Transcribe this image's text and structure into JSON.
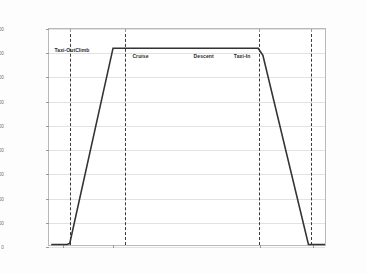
{
  "chart_data": {
    "type": "line",
    "title": "",
    "xlabel": "",
    "ylabel": "Flight Altitude (ft)",
    "ylim": [
      0,
      9000
    ],
    "ytick_labels": [
      "9000",
      "8000",
      "7000",
      "6000",
      "5000",
      "4000",
      "3000",
      "2000",
      "1000",
      "0"
    ],
    "ytick_values": [
      9000,
      8000,
      7000,
      6000,
      5000,
      4000,
      3000,
      2000,
      1000,
      0
    ],
    "xlim": [
      0,
      100
    ],
    "xtick_values": [
      5,
      23,
      76,
      95
    ],
    "xtick_labels": [
      "",
      "",
      "",
      ""
    ],
    "grid": true,
    "legend": "none",
    "series": [
      {
        "name": "Flight Profile",
        "x": [
          0.8,
          6.5,
          7.5,
          23.2,
          75.8,
          77.5,
          94.0,
          100.0
        ],
        "y": [
          20,
          20,
          60,
          8200,
          8200,
          7900,
          20,
          20
        ]
      }
    ],
    "phase_dividers": [
      {
        "name": "taxi-out-climb-divider",
        "x": 7.6
      },
      {
        "name": "climb-cruise-divider",
        "x": 27.3
      },
      {
        "name": "cruise-descent-divider",
        "x": 75.5
      },
      {
        "name": "descent-taxiin-divider",
        "x": 94.2
      }
    ],
    "phase_labels": [
      {
        "name": "Taxi-Out",
        "x": 2.0,
        "y": 8140
      },
      {
        "name": "Climb",
        "x": 9.4,
        "y": 8140
      },
      {
        "name": "Cruise",
        "x": 30.0,
        "y": 7880
      },
      {
        "name": "Descent",
        "x": 52.0,
        "y": 7880
      },
      {
        "name": "Taxi-In",
        "x": 66.5,
        "y": 7880
      }
    ],
    "colors": {
      "line": "#333333",
      "divider": "#3a3a3a",
      "grid": "#e2e2e2",
      "frame": "#b9b9b9",
      "text": "#6d6d6d",
      "background": "#ffffff"
    }
  }
}
